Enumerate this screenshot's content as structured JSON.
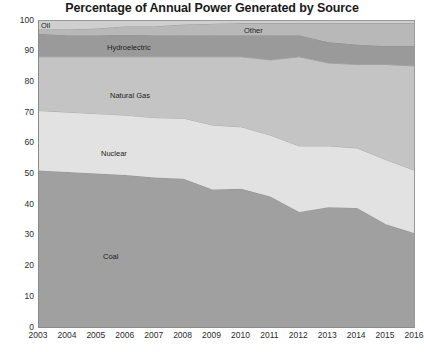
{
  "chart_data": {
    "type": "area",
    "stacked": true,
    "title": "Percentage of Annual Power Generated by Source",
    "xlabel": "",
    "ylabel": "",
    "ylim": [
      0,
      100
    ],
    "ytick_step": 10,
    "grid": false,
    "legend": "inline-labels",
    "x": [
      "2003",
      "2004",
      "2005",
      "2006",
      "2007",
      "2008",
      "2009",
      "2010",
      "2011",
      "2012",
      "2013",
      "2014",
      "2015",
      "2016"
    ],
    "categories": [
      "2003",
      "2004",
      "2005",
      "2006",
      "2007",
      "2008",
      "2009",
      "2010",
      "2011",
      "2012",
      "2013",
      "2014",
      "2015",
      "2016"
    ],
    "yticks": [
      "0",
      "10",
      "20",
      "30",
      "40",
      "50",
      "60",
      "70",
      "80",
      "90",
      "100"
    ],
    "series": [
      {
        "name": "Coal",
        "color": "#a0a0a0",
        "values": [
          51.0,
          50.5,
          50.0,
          49.5,
          48.7,
          48.3,
          44.8,
          45.0,
          42.5,
          37.5,
          39.0,
          38.8,
          33.5,
          30.5
        ]
      },
      {
        "name": "Nuclear",
        "color": "#e2e2e2",
        "values": [
          19.5,
          19.5,
          19.5,
          19.5,
          19.5,
          19.7,
          21.0,
          20.2,
          20.0,
          21.5,
          20.0,
          19.5,
          21.0,
          20.5
        ]
      },
      {
        "name": "Natural Gas",
        "color": "#c4c4c4",
        "values": [
          17.5,
          18.0,
          18.5,
          19.0,
          19.8,
          20.0,
          22.2,
          22.8,
          24.5,
          29.0,
          27.0,
          27.2,
          31.0,
          34.0
        ]
      },
      {
        "name": "Hydroelectric",
        "color": "#9a9a9a",
        "values": [
          7.5,
          7.0,
          7.0,
          7.2,
          7.0,
          7.0,
          7.0,
          7.0,
          8.0,
          7.0,
          6.8,
          6.5,
          6.0,
          6.5
        ]
      },
      {
        "name": "Other",
        "color": "#b8b8b8",
        "values": [
          1.5,
          2.0,
          2.2,
          2.8,
          3.0,
          3.5,
          3.8,
          4.0,
          4.0,
          4.0,
          6.2,
          7.0,
          7.5,
          7.5
        ]
      },
      {
        "name": "Oil",
        "color": "#cfcfcf",
        "values": [
          3.0,
          3.0,
          2.8,
          2.0,
          2.0,
          1.5,
          1.2,
          1.0,
          1.0,
          1.0,
          1.0,
          1.0,
          1.0,
          1.0
        ]
      }
    ],
    "annotations": [
      {
        "text": "Oil",
        "x_px": 41,
        "y_px": 22
      },
      {
        "text": "Other",
        "x_px": 244,
        "y_px": 27
      },
      {
        "text": "Hydroelectric",
        "x_px": 107,
        "y_px": 44
      },
      {
        "text": "Natural Gas",
        "x_px": 110,
        "y_px": 92
      },
      {
        "text": "Nuclear",
        "x_px": 101,
        "y_px": 150
      },
      {
        "text": "Coal",
        "x_px": 103,
        "y_px": 253
      }
    ]
  }
}
